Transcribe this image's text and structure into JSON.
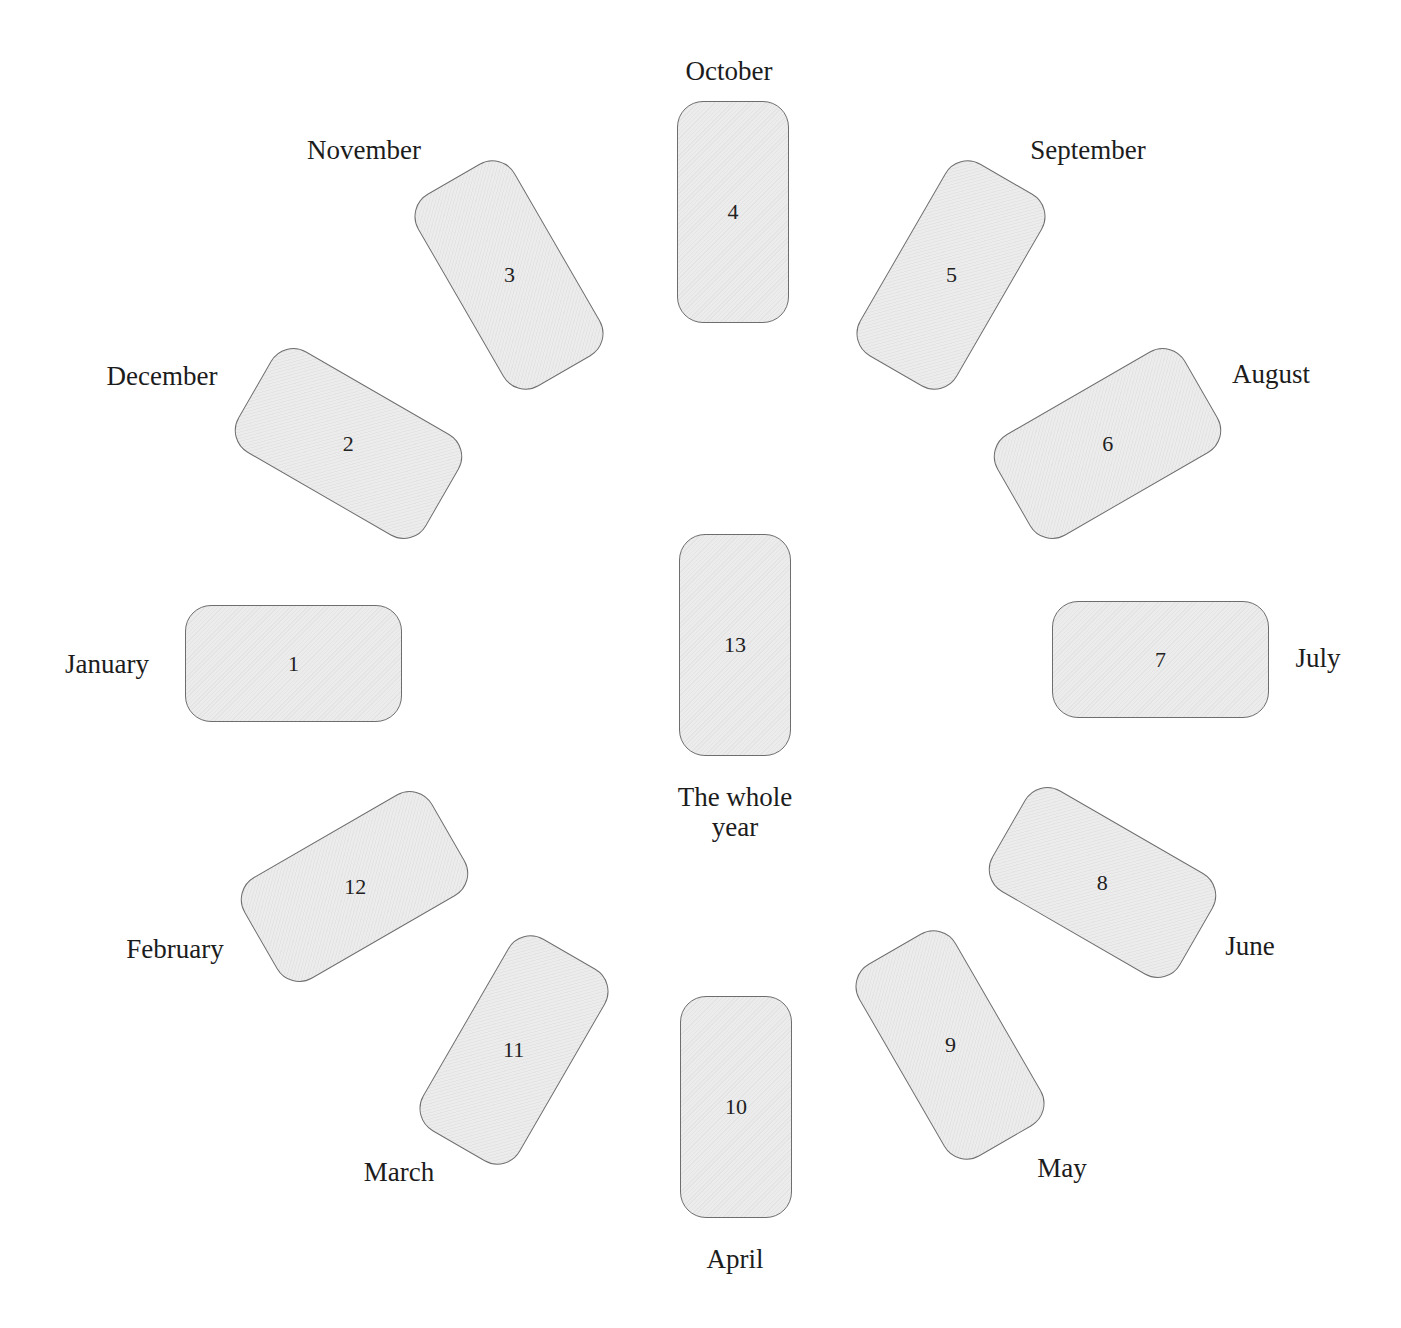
{
  "header": {
    "cutoff_text": ""
  },
  "spread": {
    "center_card": {
      "number": "13",
      "label_line1": "The whole",
      "label_line2": "year"
    },
    "cards": [
      {
        "number": "1",
        "month": "January"
      },
      {
        "number": "2",
        "month": "December"
      },
      {
        "number": "3",
        "month": "November"
      },
      {
        "number": "4",
        "month": "October"
      },
      {
        "number": "5",
        "month": "September"
      },
      {
        "number": "6",
        "month": "August"
      },
      {
        "number": "7",
        "month": "July"
      },
      {
        "number": "8",
        "month": "June"
      },
      {
        "number": "9",
        "month": "May"
      },
      {
        "number": "10",
        "month": "April"
      },
      {
        "number": "11",
        "month": "March"
      },
      {
        "number": "12",
        "month": "February"
      }
    ]
  },
  "colors": {
    "card_fill": "#e8e8e8",
    "card_border": "#6e6e6e",
    "text": "#1c1c1c",
    "background": "#ffffff"
  }
}
